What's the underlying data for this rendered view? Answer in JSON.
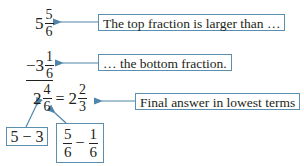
{
  "colors": {
    "arrow": "#4f86a8",
    "box_border": "#5b8fb0",
    "text": "#231f20"
  },
  "top_number": {
    "whole": "5",
    "numerator": "5",
    "denominator": "6"
  },
  "bottom_number": {
    "sign": "−",
    "whole": "3",
    "numerator": "1",
    "denominator": "6"
  },
  "result": {
    "whole": "2",
    "numerator": "4",
    "denominator": "6",
    "equals": "=",
    "simplified_whole": "2",
    "simplified_numerator": "2",
    "simplified_denominator": "3"
  },
  "callouts": {
    "top": "The top fraction is larger than …",
    "bottom": "… the bottom fraction.",
    "final": "Final answer in lowest terms"
  },
  "whole_calc": {
    "a": "5",
    "op": "−",
    "b": "3"
  },
  "fraction_calc": {
    "a_num": "5",
    "a_den": "6",
    "op": "−",
    "b_num": "1",
    "b_den": "6"
  }
}
